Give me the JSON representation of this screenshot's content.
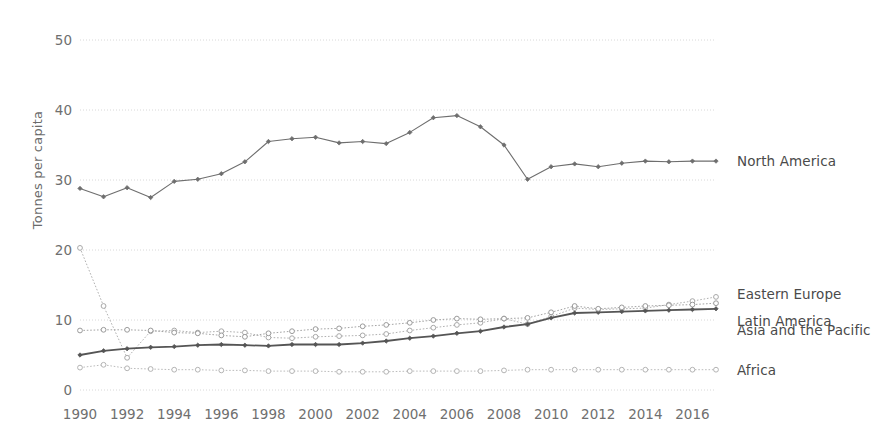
{
  "chart_data": {
    "type": "line",
    "title": "",
    "subtitle": "",
    "xlabel": "",
    "ylabel": "Tonnes per capita",
    "xlim": [
      1990,
      2017
    ],
    "ylim": [
      0,
      52
    ],
    "grid": true,
    "grid_axis": "y",
    "legend_position": "right-inline",
    "x": [
      1990,
      1991,
      1992,
      1993,
      1994,
      1995,
      1996,
      1997,
      1998,
      1999,
      2000,
      2001,
      2002,
      2003,
      2004,
      2005,
      2006,
      2007,
      2008,
      2009,
      2010,
      2011,
      2012,
      2013,
      2014,
      2015,
      2016,
      2017
    ],
    "xticks": [
      1990,
      1992,
      1994,
      1996,
      1998,
      2000,
      2002,
      2004,
      2006,
      2008,
      2010,
      2012,
      2014,
      2016
    ],
    "xticklabels": [
      "1990",
      "1992",
      "1994",
      "1996",
      "1998",
      "2000",
      "2002",
      "2004",
      "2006",
      "2008",
      "2010",
      "2012",
      "2014",
      "2016"
    ],
    "yticks": [
      0,
      10,
      20,
      30,
      40,
      50
    ],
    "yticklabels": [
      "0",
      "10",
      "20",
      "30",
      "40",
      "50"
    ],
    "series": [
      {
        "name": "North America",
        "color": "#6e6e6e",
        "linewidth": 1.1,
        "linestyle": "solid",
        "marker": "diamond",
        "values": [
          28.8,
          27.6,
          28.9,
          27.5,
          29.8,
          30.1,
          30.9,
          32.6,
          35.5,
          35.9,
          36.1,
          35.3,
          35.5,
          35.2,
          36.8,
          38.9,
          39.2,
          37.6,
          35.0,
          30.1,
          31.9,
          32.3,
          31.9,
          32.4,
          32.7,
          32.6,
          32.7,
          32.7
        ]
      },
      {
        "name": "Eastern Europe",
        "color": "#a8a8a8",
        "linewidth": 0.9,
        "linestyle": "dotted",
        "marker": "circle",
        "values": [
          20.3,
          12.0,
          4.6,
          8.4,
          8.5,
          8.2,
          8.4,
          8.2,
          7.5,
          7.4,
          7.6,
          7.7,
          7.8,
          8.0,
          8.5,
          8.9,
          9.3,
          9.6,
          10.2,
          9.4,
          10.5,
          11.7,
          11.5,
          11.6,
          11.7,
          12.2,
          12.7,
          13.3
        ]
      },
      {
        "name": "Latin America",
        "color": "#555555",
        "linewidth": 1.8,
        "linestyle": "solid",
        "marker": "diamond",
        "values": [
          5.0,
          5.6,
          5.9,
          6.1,
          6.2,
          6.4,
          6.5,
          6.4,
          6.3,
          6.5,
          6.5,
          6.5,
          6.7,
          7.0,
          7.4,
          7.7,
          8.1,
          8.4,
          9.0,
          9.4,
          10.3,
          11.0,
          11.1,
          11.2,
          11.3,
          11.4,
          11.5,
          11.6
        ]
      },
      {
        "name": "Asia and the Pacific",
        "color": "#9a9a9a",
        "linewidth": 0.9,
        "linestyle": "dotted",
        "marker": "circle",
        "values": [
          8.5,
          8.6,
          8.6,
          8.5,
          8.2,
          8.1,
          7.8,
          7.6,
          8.1,
          8.4,
          8.7,
          8.8,
          9.1,
          9.3,
          9.6,
          10.0,
          10.2,
          10.1,
          10.2,
          10.3,
          11.1,
          12.0,
          11.6,
          11.8,
          12.0,
          12.1,
          12.2,
          12.4
        ]
      },
      {
        "name": "Africa",
        "color": "#b4b4b4",
        "linewidth": 0.9,
        "linestyle": "dotted",
        "marker": "circle",
        "values": [
          3.2,
          3.6,
          3.1,
          3.0,
          2.9,
          2.9,
          2.8,
          2.8,
          2.7,
          2.7,
          2.7,
          2.6,
          2.6,
          2.6,
          2.7,
          2.7,
          2.7,
          2.7,
          2.8,
          2.9,
          2.9,
          2.9,
          2.9,
          2.9,
          2.9,
          2.9,
          2.9,
          2.9
        ]
      }
    ],
    "series_labels": [
      {
        "text": "North America",
        "y_value": 32.7
      },
      {
        "text": "Eastern Europe",
        "y_value": 13.3
      },
      {
        "text": "Latin America",
        "y_value": 11.6
      },
      {
        "text": "Asia and the Pacific",
        "y_value": 12.4
      },
      {
        "text": "Africa",
        "y_value": 2.9
      }
    ],
    "colors": {
      "grid": "#d8d8d8",
      "text": "#6f6f6f",
      "background": "#ffffff"
    }
  }
}
